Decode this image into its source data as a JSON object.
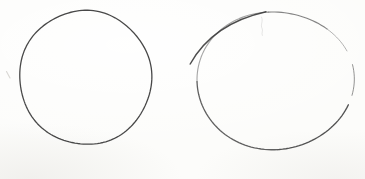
{
  "canvas": {
    "width": 365,
    "height": 179,
    "background": "#fcfcfa",
    "ink_dark": "#3e3e3e",
    "ink_light": "#8f8f8f"
  },
  "shapes": [
    {
      "id": "left-circle",
      "type": "ellipse-sketch",
      "cx": 85.5,
      "cy": 77.5,
      "rx": 65.5,
      "ry": 67.5,
      "rotation": 0,
      "wobble": {
        "a1": 0.6,
        "k1": 2,
        "p1": 1.1,
        "a2": 0.45,
        "k2": 5,
        "p2": 2.3
      },
      "segments": [
        {
          "id": "outline",
          "from": -88,
          "to": 272,
          "color": "#3e3e3e",
          "width": 1.3,
          "opacity": 0.95
        }
      ]
    },
    {
      "id": "right-ellipse",
      "type": "ellipse-sketch",
      "cx": 275,
      "cy": 80.5,
      "rx": 78,
      "ry": 69.5,
      "rotation": -8,
      "wobble": {
        "a1": 1.3,
        "k1": 2,
        "p1": 0.4,
        "a2": 0.8,
        "k2": 3,
        "p2": 1.7
      },
      "segments": [
        {
          "id": "upper-left-light",
          "from": 188,
          "to": 272,
          "color": "#8f8f8f",
          "width": 1.1,
          "opacity": 0.8
        },
        {
          "id": "top-right",
          "from": 272,
          "to": 320,
          "color": "#6e6e6e",
          "width": 1.15,
          "opacity": 0.85
        },
        {
          "id": "upper-right-faint",
          "from": 320,
          "to": 344,
          "color": "#949494",
          "width": 1.0,
          "opacity": 0.7
        },
        {
          "id": "right-mid",
          "from": 356,
          "to": 381,
          "color": "#6f6f6f",
          "width": 1.0,
          "opacity": 0.75
        },
        {
          "id": "lower-right",
          "from": 389,
          "to": 455,
          "color": "#4a4a4a",
          "width": 1.35,
          "opacity": 0.95
        },
        {
          "id": "bottom-left",
          "from": 95,
          "to": 188,
          "color": "#575757",
          "width": 1.3,
          "opacity": 0.95
        }
      ]
    }
  ],
  "strokes": [
    {
      "id": "right-ellipse-overshoot",
      "d": "M 190.2,64 C 205,37.5 231.5,19.5 266,11.8",
      "color": "#3a3a3a",
      "width": 1.45,
      "opacity": 0.9
    },
    {
      "id": "faint-smudge",
      "d": "M 261.5,17 c 2.2,4.5 -1.5,7.5 0.6,11.5 c 1.2,2.5 -1,4.5 0.2,7",
      "color": "#9a9a9a",
      "width": 0.8,
      "opacity": 0.3
    },
    {
      "id": "margin-speck",
      "d": "M 6.5,71.5 l 3.5,6.5",
      "color": "#b5b2ac",
      "width": 1.1,
      "opacity": 0.5
    }
  ]
}
